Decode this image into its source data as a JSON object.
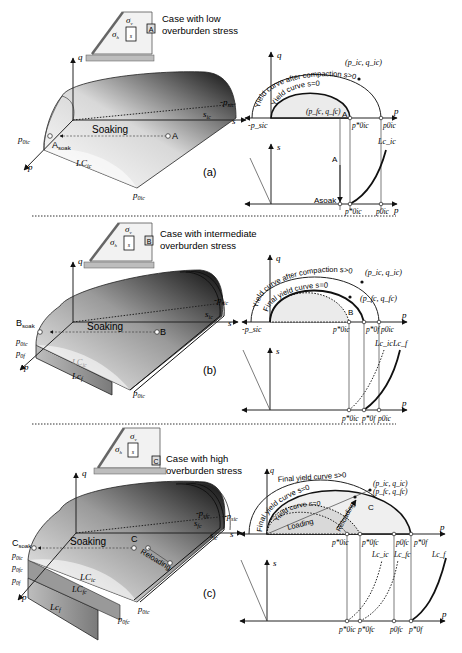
{
  "panels": [
    {
      "id": "a",
      "tag": "(a)",
      "inset": {
        "badge": "A",
        "caption_line1": "Case with low",
        "caption_line2": "overburden stress",
        "sigma_v": "σ",
        "sigma_v_sub": "v",
        "sigma_h": "σ",
        "sigma_h_sub": "h",
        "s": "s"
      },
      "surface3d": {
        "q_axis": "q",
        "p_axis": "p",
        "s_axis": "s",
        "neg_psic": "-p",
        "neg_psic_sub": "sic",
        "s_ic": "s",
        "s_ic_sub": "ic",
        "soaking": "Soaking",
        "point": "A",
        "point_soak": "A",
        "point_soak_sub": "soak",
        "p0ic_star": "p",
        "p0ic_star_sub": "0ic",
        "lc": "LC",
        "lc_sub": "ic",
        "p0ic": "p",
        "p0ic_sub": "0ic"
      },
      "pq_plot": {
        "q": "q",
        "p": "p",
        "outer_curve": "Yield curve after compaction s>0",
        "inner_curve": "Yield curve s=0",
        "pic_qic": "(p_ic, q_ic)",
        "pfc_qfc": "(p_fc, q_fc)",
        "point": "A",
        "neg_psic": "-p_sic",
        "p0ic_star": "p*0ic",
        "p0ic": "p0ic"
      },
      "ps_plot": {
        "s": "s",
        "p": "p",
        "point": "A",
        "point_soak": "Asoak",
        "lc": "Lc_ic",
        "p0ic_star": "p*0ic",
        "p0ic": "p0ic"
      }
    },
    {
      "id": "b",
      "tag": "(b)",
      "inset": {
        "badge": "B",
        "caption_line1": "Case with intermediate",
        "caption_line2": "overburden stress",
        "sigma_v": "σ",
        "sigma_v_sub": "v",
        "sigma_h": "σ",
        "sigma_h_sub": "h",
        "s": "s"
      },
      "surface3d": {
        "q_axis": "q",
        "p_axis": "p",
        "s_axis": "s",
        "neg_psic": "-p",
        "neg_psic_sub": "sic",
        "s_ic": "s",
        "s_ic_sub": "ic",
        "soaking": "Soaking",
        "point": "B",
        "point_soak": "B",
        "point_soak_sub": "soak",
        "p0ic_star": "p",
        "p0ic_star_sub": "0ic",
        "p0f_star": "p",
        "p0f_star_sub": "0f",
        "lc_ic": "LC",
        "lc_ic_sub": "ic",
        "lc_f": "Lc",
        "lc_f_sub": "f",
        "p0ic": "p",
        "p0ic_sub": "0ic"
      },
      "pq_plot": {
        "q": "q",
        "p": "p",
        "outer_curve": "Yield curve after compaction s>0",
        "inner_curve": "Final yield curve s=0",
        "pic_qic": "(p_ic, q_ic)",
        "pfc_qfc": "(p_fc, q_fc)",
        "point": "B",
        "neg_psic": "-p_sic",
        "p0ic_star": "p*0ic",
        "p0f_star": "p*0f",
        "p0ic": "p0ic"
      },
      "ps_plot": {
        "s": "s",
        "p": "p",
        "lc_ic": "Lc_ic",
        "lc_f": "Lc_f",
        "p0ic_star": "p*0ic",
        "p0f_star": "p*0f",
        "p0ic": "p0ic"
      }
    },
    {
      "id": "c",
      "tag": "(c)",
      "inset": {
        "badge": "C",
        "caption_line1": "Case with high",
        "caption_line2": "overburden stress",
        "sigma_v": "σ",
        "sigma_v_sub": "v",
        "sigma_h": "σ",
        "sigma_h_sub": "h",
        "s": "s"
      },
      "surface3d": {
        "q_axis": "q",
        "p_axis": "p",
        "s_axis": "s",
        "neg_psfc": "-p",
        "neg_psfc_sub": "sfc",
        "neg_psic": "-p",
        "neg_psic_sub": "sic",
        "s_fc": "s",
        "s_fc_sub": "fc",
        "s_ic": "s",
        "s_ic_sub": "ic",
        "soaking": "Soaking",
        "reloading": "Reloading",
        "point": "C",
        "point_soak": "C",
        "point_soak_sub": "soak",
        "p0ic_star": "p",
        "p0ic_star_sub": "0ic",
        "p0fc_star": "p",
        "p0fc_star_sub": "0fc",
        "p0f": "p",
        "p0f_sub": "0f",
        "lc_ic": "LC",
        "lc_ic_sub": "ic",
        "lc_fc": "LC",
        "lc_fc_sub": "fc",
        "lc_f": "Lc",
        "lc_f_sub": "f",
        "p0ic": "p",
        "p0ic_sub": "0ic",
        "p0fc": "p",
        "p0fc_sub": "0fc"
      },
      "pq_plot": {
        "q": "q",
        "p": "p",
        "final_s_gt0": "Final yield curve s>0",
        "final_s_eq0": "Final yield curve s=0",
        "yield_s_eq0": "Yield curve s=0",
        "loading": "Loading",
        "reloading": "Reloading",
        "pic_qic": "(p_ic, q_ic)",
        "pfc_qfc": "(p_fc, q_fc)",
        "point": "C",
        "neg_psic": "-p_sic",
        "p0ic_star": "p*0ic",
        "p0fc_star": "p*0fc",
        "p0fc": "p0fc",
        "p0f_star": "p*0f"
      },
      "ps_plot": {
        "s": "s",
        "p": "p",
        "lc_ic": "Lc_ic",
        "lc_fc": "Lc_fc",
        "lc_f": "Lc_f",
        "p0ic_star": "p*0ic",
        "p0fc_star": "p*0fc",
        "p0fc": "p0fc",
        "p0f_star": "p*0f"
      }
    }
  ]
}
